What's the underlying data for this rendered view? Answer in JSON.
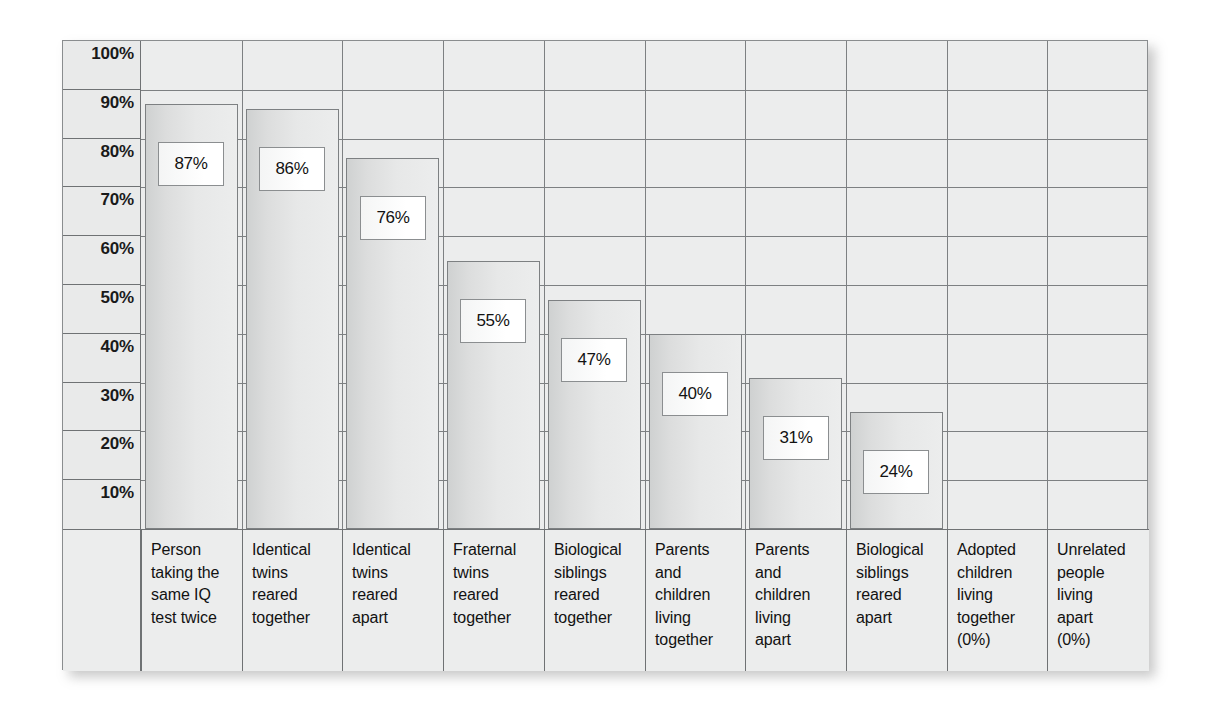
{
  "chart_data": {
    "type": "bar",
    "title": "",
    "xlabel": "",
    "ylabel": "",
    "ylim": [
      0,
      100
    ],
    "grid": true,
    "legend": "none",
    "y_ticks": [
      "100%",
      "90%",
      "80%",
      "70%",
      "60%",
      "50%",
      "40%",
      "30%",
      "20%",
      "10%"
    ],
    "categories": [
      "Person\ntaking the\nsame IQ\ntest twice",
      "Identical\ntwins\nreared\ntogether",
      "Identical\ntwins\nreared\napart",
      "Fraternal\ntwins\nreared\ntogether",
      "Biological\nsiblings\nreared\ntogether",
      "Parents\nand\nchildren\nliving\ntogether",
      "Parents\nand\nchildren\nliving\napart",
      "Biological\nsiblings\nreared\napart",
      "Adopted\nchildren\nliving\ntogether\n(0%)",
      "Unrelated\npeople\nliving\napart\n(0%)"
    ],
    "values": [
      87,
      86,
      76,
      55,
      47,
      40,
      31,
      24,
      0,
      0
    ],
    "value_labels": [
      "87%",
      "86%",
      "76%",
      "55%",
      "47%",
      "40%",
      "31%",
      "24%",
      "",
      ""
    ]
  },
  "colors": {
    "frame_background": "#eceded",
    "grid_line": "#7d8082",
    "frame_border": "#8a8d8f",
    "bar_fill": "#dcdddd",
    "bar_border": "#7d8082",
    "value_box_fill": "#ffffff",
    "text": "#121212",
    "page_background": "#ffffff"
  }
}
